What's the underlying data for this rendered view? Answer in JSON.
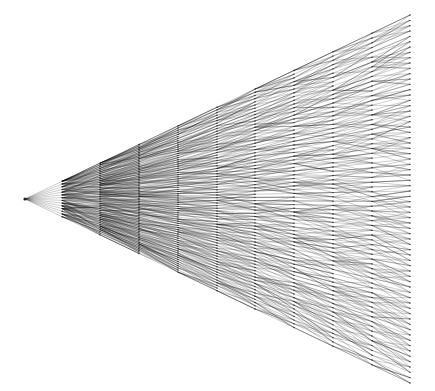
{
  "diagram": {
    "type": "tree",
    "orientation": "left-to-right",
    "root": {
      "x": 25,
      "y": 199
    },
    "column_x": [
      25,
      62,
      100,
      139,
      178,
      217,
      255,
      294,
      333,
      372,
      410
    ],
    "right_extent": {
      "top": 15,
      "bottom": 383
    },
    "branching": [
      14,
      3,
      2,
      2,
      2,
      2,
      2,
      2,
      2,
      2
    ],
    "colors": {
      "edge": "#000000",
      "node": "#222222",
      "background": "#ffffff"
    }
  }
}
